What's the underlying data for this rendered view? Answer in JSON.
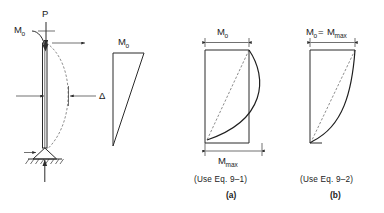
{
  "figure": {
    "background_color": "#ffffff",
    "line_color": "#2b2b2b",
    "dash_color": "#5a5a5a"
  },
  "panels": [
    {
      "id": "loaded-column",
      "name": "loaded-column-diagram",
      "labels": {
        "axial_load": "P",
        "applied_moment": "M",
        "applied_moment_sub": "o",
        "deflection": "Δ"
      },
      "elements": {
        "axial_load_arrow": "down-arrow",
        "moment_arrow": "curved-moment-arrow",
        "lateral_arrow": "right-arrow",
        "support": "pin-support-with-hatching",
        "reaction_arrow": "up-arrow",
        "deflected_shape": "dashed-curve"
      }
    },
    {
      "id": "primary-moment",
      "name": "primary-moment-diagram",
      "labels": {
        "moment": "M",
        "moment_sub": "o"
      },
      "shape": "triangle"
    },
    {
      "id": "magnified-moment-a",
      "name": "magnified-moment-diagram-a",
      "labels": {
        "top_moment": "M",
        "top_moment_sub": "o",
        "bottom_moment": "M",
        "bottom_moment_sub": "max",
        "equation_note": "(Use Eq. 9–1)",
        "panel_letter": "(a)"
      },
      "shape": "bulging-curve-exceeding-right-edge"
    },
    {
      "id": "magnified-moment-b",
      "name": "magnified-moment-diagram-b",
      "labels": {
        "top_moment_lhs": "M",
        "top_moment_lhs_sub": "o",
        "equals": "=",
        "top_moment_rhs": "M",
        "top_moment_rhs_sub": "max",
        "equation_note": "(Use Eq. 9–2)",
        "panel_letter": "(b)"
      },
      "shape": "curve-within-right-edge"
    }
  ]
}
